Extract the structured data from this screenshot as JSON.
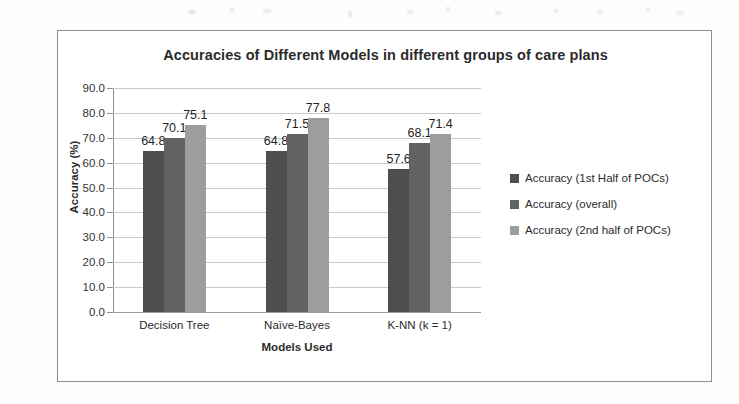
{
  "chart_data": {
    "type": "bar",
    "title": "Accuracies of Different Models in different groups of care plans",
    "xlabel": "Models Used",
    "ylabel": "Accuracy (%)",
    "categories": [
      "Decision Tree",
      "Naïve-Bayes",
      "K-NN (k = 1)"
    ],
    "series": [
      {
        "name": "Accuracy (1st Half  of POCs)",
        "color": "#4e4e4e",
        "values": [
          64.8,
          64.8,
          57.6
        ]
      },
      {
        "name": "Accuracy (overall)",
        "color": "#636363",
        "values": [
          70.1,
          71.5,
          68.1
        ]
      },
      {
        "name": "Accuracy (2nd half of POCs)",
        "color": "#9d9d9d",
        "values": [
          75.1,
          77.8,
          71.4
        ]
      }
    ],
    "ylim": [
      0,
      90
    ],
    "ytick_step": 10,
    "ytick_labels": [
      "90.0",
      "80.0",
      "70.0",
      "60.0",
      "50.0",
      "40.0",
      "30.0",
      "20.0",
      "10.0",
      "0.0"
    ],
    "ytick_values": [
      90,
      80,
      70,
      60,
      50,
      40,
      30,
      20,
      10,
      0
    ],
    "grid": true,
    "legend_position": "right",
    "data_labels": true,
    "data_label_format": "one-decimal"
  },
  "frame": {
    "border_color": "#8d8d8d"
  }
}
